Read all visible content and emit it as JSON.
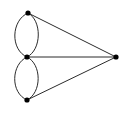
{
  "figure": {
    "type": "graph-diagram",
    "width": 127,
    "height": 115,
    "background_color": "#ffffff",
    "edge_color": "#2b2b2b",
    "edge_width": 1,
    "vertex_color": "#000000",
    "vertex_radius": 2.6
  },
  "graph": {
    "vertex_count": 4,
    "edge_count": 7,
    "vertices": [
      {
        "id": "v-top",
        "label": "top vertex",
        "x": 28,
        "y": 13
      },
      {
        "id": "v-middle",
        "label": "middle vertex",
        "x": 27,
        "y": 57
      },
      {
        "id": "v-bottom",
        "label": "bottom vertex",
        "x": 27,
        "y": 100
      },
      {
        "id": "v-right",
        "label": "right vertex",
        "x": 116,
        "y": 57
      }
    ],
    "edges": [
      {
        "id": "e-top-mid-left",
        "from": "v-top",
        "to": "v-middle",
        "shape": "arc",
        "bulge": "left",
        "path": "M 28 13 C 11 20, 10 50, 27 57"
      },
      {
        "id": "e-top-mid-right",
        "from": "v-top",
        "to": "v-middle",
        "shape": "arc",
        "bulge": "right",
        "path": "M 28 13 C 42 20, 42 50, 27 57"
      },
      {
        "id": "e-mid-bot-left",
        "from": "v-middle",
        "to": "v-bottom",
        "shape": "arc",
        "bulge": "left",
        "path": "M 27 57 C 11 64, 10 93, 27 100"
      },
      {
        "id": "e-mid-bot-right",
        "from": "v-middle",
        "to": "v-bottom",
        "shape": "arc",
        "bulge": "right",
        "path": "M 27 57 C 42 64, 42 93, 27 100"
      },
      {
        "id": "e-top-right",
        "from": "v-top",
        "to": "v-right",
        "shape": "straight",
        "bulge": "none",
        "path": "M 28 13 L 116 57"
      },
      {
        "id": "e-middle-right",
        "from": "v-middle",
        "to": "v-right",
        "shape": "straight",
        "bulge": "none",
        "path": "M 27 57 L 116 57"
      },
      {
        "id": "e-bottom-right",
        "from": "v-bottom",
        "to": "v-right",
        "shape": "straight",
        "bulge": "none",
        "path": "M 27 100 L 116 57"
      }
    ]
  }
}
